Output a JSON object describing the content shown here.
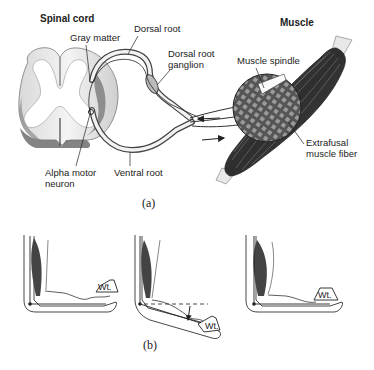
{
  "figure": {
    "panel_a": {
      "caption": "(a)",
      "labels": {
        "spinal_cord": "Spinal cord",
        "gray_matter": "Gray matter",
        "dorsal_root": "Dorsal root",
        "dorsal_root_ganglion_line1": "Dorsal root",
        "dorsal_root_ganglion_line2": "ganglion",
        "alpha_motor_neuron_line1": "Alpha motor",
        "alpha_motor_neuron_line2": "neuron",
        "ventral_root": "Ventral root",
        "muscle": "Muscle",
        "muscle_spindle": "Muscle spindle",
        "extrafusal_line1": "Extrafusal",
        "extrafusal_line2": "muscle fiber"
      }
    },
    "panel_b": {
      "caption": "(b)",
      "weight_label": "Wt.",
      "stages": [
        "arm holding weight",
        "arm drops under load (stretch)",
        "arm restored by reflex"
      ]
    },
    "colors": {
      "ink": "#222222",
      "gray_matter": "#7a7a7a",
      "muscle_dark": "#3a3a3a"
    }
  }
}
